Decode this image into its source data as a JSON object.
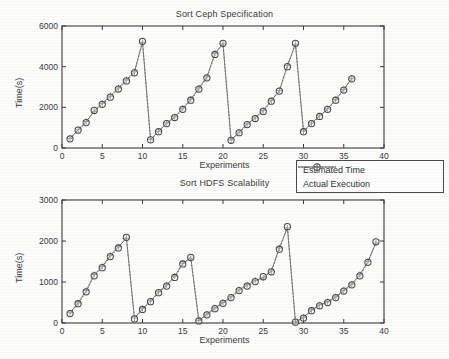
{
  "figure": {
    "legend": {
      "entries": [
        {
          "label": "Estimated Time",
          "style": "dotted-circle",
          "color": "#555555"
        },
        {
          "label": "Actual Execution",
          "style": "solid-plus",
          "color": "#6a6a6a"
        }
      ]
    }
  },
  "chart_data": [
    {
      "type": "line",
      "title": "Sort Ceph Specification",
      "xlabel": "Experiments",
      "ylabel": "Time(s)",
      "xlim": [
        0,
        40
      ],
      "ylim": [
        0,
        6000
      ],
      "xticks": [
        0,
        5,
        10,
        15,
        20,
        25,
        30,
        35,
        40
      ],
      "yticks": [
        0,
        2000,
        4000,
        6000
      ],
      "grid": false,
      "legend_position": "below-right",
      "x": [
        1,
        2,
        3,
        4,
        5,
        6,
        7,
        8,
        9,
        10,
        11,
        12,
        13,
        14,
        15,
        16,
        17,
        18,
        19,
        20,
        21,
        22,
        23,
        24,
        25,
        26,
        27,
        28,
        29,
        30,
        31,
        32,
        33,
        34,
        35,
        36
      ],
      "series": [
        {
          "name": "Estimated Time",
          "values": [
            450,
            880,
            1250,
            1850,
            2150,
            2500,
            2900,
            3300,
            3700,
            5250,
            400,
            800,
            1200,
            1500,
            1900,
            2350,
            2900,
            3450,
            4600,
            5150,
            380,
            750,
            1150,
            1450,
            1800,
            2300,
            2800,
            4000,
            5150,
            800,
            1200,
            1550,
            1900,
            2350,
            2850,
            3400,
            4500,
            5100
          ]
        },
        {
          "name": "Actual Execution",
          "values": [
            470,
            900,
            1300,
            1800,
            2200,
            2550,
            2950,
            3350,
            3750,
            5200,
            420,
            820,
            1230,
            1530,
            1950,
            2400,
            2950,
            3500,
            4650,
            5120,
            400,
            780,
            1180,
            1480,
            1850,
            2330,
            2830,
            4050,
            5100,
            830,
            1230,
            1580,
            1930,
            2380,
            2880,
            3430,
            4450,
            5000
          ]
        }
      ],
      "segments": [
        {
          "from": 1,
          "to": 10
        },
        {
          "from": 11,
          "to": 19
        },
        {
          "from": 20,
          "to": 28
        },
        {
          "from": 29,
          "to": 36
        }
      ]
    },
    {
      "type": "line",
      "title": "Sort HDFS Scalability",
      "xlabel": "Experiments",
      "ylabel": "Time(s)",
      "xlim": [
        0,
        40
      ],
      "ylim": [
        0,
        3000
      ],
      "xticks": [
        0,
        5,
        10,
        15,
        20,
        25,
        30,
        35,
        40
      ],
      "yticks": [
        0,
        1000,
        2000,
        3000
      ],
      "grid": false,
      "legend_position": "above-right",
      "x": [
        1,
        2,
        3,
        4,
        5,
        6,
        7,
        8,
        9,
        10,
        11,
        12,
        13,
        14,
        15,
        16,
        17,
        18,
        19,
        20,
        21,
        22,
        23,
        24,
        25,
        26,
        27,
        28,
        29,
        30,
        31,
        32,
        33,
        34,
        35,
        36,
        37,
        38,
        39
      ],
      "series": [
        {
          "name": "Estimated Time",
          "values": [
            230,
            470,
            760,
            1150,
            1350,
            1620,
            1830,
            2090,
            100,
            330,
            520,
            740,
            900,
            1110,
            1440,
            1600,
            50,
            200,
            350,
            480,
            620,
            790,
            900,
            1010,
            1130,
            1250,
            1800,
            2350,
            20,
            120,
            300,
            420,
            500,
            620,
            780,
            930,
            1150,
            1480,
            1980
          ]
        },
        {
          "name": "Actual Execution",
          "values": [
            250,
            490,
            790,
            1180,
            1380,
            1650,
            1860,
            2070,
            120,
            350,
            540,
            760,
            930,
            1140,
            1460,
            1580,
            60,
            220,
            370,
            500,
            640,
            810,
            930,
            1040,
            1100,
            1270,
            1830,
            2320,
            30,
            140,
            320,
            440,
            520,
            640,
            800,
            950,
            1180,
            1500,
            1950
          ]
        }
      ],
      "segments": [
        {
          "from": 1,
          "to": 8
        },
        {
          "from": 9,
          "to": 16
        },
        {
          "from": 17,
          "to": 28
        },
        {
          "from": 29,
          "to": 39
        }
      ]
    }
  ]
}
